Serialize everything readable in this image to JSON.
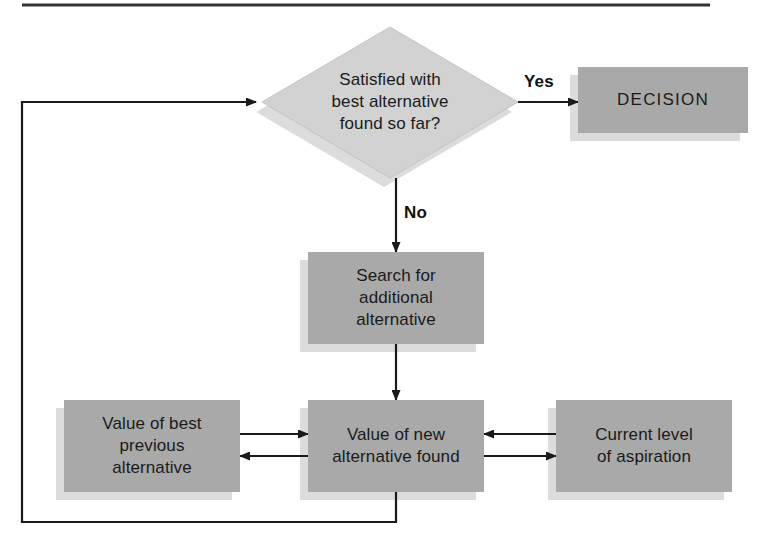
{
  "diagram": {
    "colors": {
      "box_fill": "#a9a9a9",
      "diamond_fill": "#d2d2d2",
      "shadow_fill": "#d8d8d8",
      "line": "#1a1a1a",
      "text": "#1a1a1a",
      "background": "#ffffff",
      "rule": "#333333"
    },
    "top_rule": {
      "present": true
    },
    "nodes": [
      {
        "id": "decision-diamond",
        "shape": "diamond",
        "label": "Satisfied with\nbest alternative\nfound so far?",
        "x": 262,
        "y": 27,
        "width": 256,
        "height": 151
      },
      {
        "id": "decision-outcome",
        "shape": "rect",
        "label": "DECISION",
        "x": 578,
        "y": 67,
        "width": 170,
        "height": 66
      },
      {
        "id": "search-additional",
        "shape": "rect",
        "label": "Search for\nadditional\nalternative",
        "x": 308,
        "y": 252,
        "width": 176,
        "height": 92
      },
      {
        "id": "value-best-previous",
        "shape": "rect",
        "label": "Value of best\nprevious\nalternative",
        "x": 64,
        "y": 400,
        "width": 176,
        "height": 92
      },
      {
        "id": "value-new-alternative",
        "shape": "rect",
        "label": "Value of new\nalternative found",
        "x": 308,
        "y": 400,
        "width": 176,
        "height": 92
      },
      {
        "id": "current-aspiration",
        "shape": "rect",
        "label": "Current level\nof aspiration",
        "x": 556,
        "y": 400,
        "width": 176,
        "height": 92
      }
    ],
    "edges": [
      {
        "id": "yes-edge",
        "label": "Yes",
        "from": "decision-diamond",
        "to": "decision-outcome"
      },
      {
        "id": "no-edge",
        "label": "No",
        "from": "decision-diamond",
        "to": "search-additional"
      },
      {
        "id": "search-to-value",
        "label": "",
        "from": "search-additional",
        "to": "value-new-alternative"
      },
      {
        "id": "prev-to-new",
        "label": "",
        "from": "value-best-previous",
        "to": "value-new-alternative"
      },
      {
        "id": "new-to-prev",
        "label": "",
        "from": "value-new-alternative",
        "to": "value-best-previous"
      },
      {
        "id": "aspiration-to-new",
        "label": "",
        "from": "current-aspiration",
        "to": "value-new-alternative"
      },
      {
        "id": "new-to-aspiration",
        "label": "",
        "from": "value-new-alternative",
        "to": "current-aspiration"
      },
      {
        "id": "feedback-loop",
        "label": "",
        "from": "value-new-alternative",
        "to": "decision-diamond"
      }
    ]
  }
}
